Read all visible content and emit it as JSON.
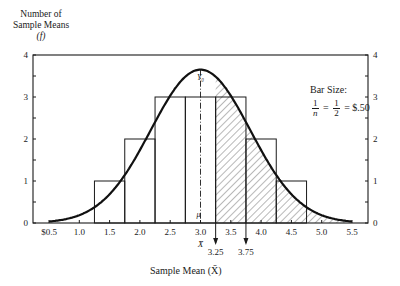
{
  "chart_data": {
    "type": "bar",
    "title": "",
    "ylabel_lines": [
      "Number of",
      "Sample Means",
      "(f)"
    ],
    "xlabel": "Sample Mean (X̄)",
    "x_tick_labels": [
      "$0.5",
      "1.0",
      "1.5",
      "2.0",
      "2.5",
      "3.0",
      "3.5",
      "4.0",
      "4.5",
      "5.0",
      "5.5"
    ],
    "x_ticks": [
      0.5,
      1.0,
      1.5,
      2.0,
      2.5,
      3.0,
      3.5,
      4.0,
      4.5,
      5.0,
      5.5
    ],
    "y_ticks_left": [
      0,
      1,
      2,
      3,
      4
    ],
    "y_ticks_right": [
      0,
      1,
      2,
      3,
      4
    ],
    "xlim": [
      0.5,
      5.5
    ],
    "ylim": [
      0,
      4
    ],
    "grid": false,
    "categories": [
      "1.5",
      "2.0",
      "2.5",
      "3.0",
      "3.5",
      "4.0",
      "4.5"
    ],
    "bins": [
      [
        1.25,
        1.75
      ],
      [
        1.75,
        2.25
      ],
      [
        2.25,
        2.75
      ],
      [
        2.75,
        3.25
      ],
      [
        3.25,
        3.75
      ],
      [
        3.75,
        4.25
      ],
      [
        4.25,
        4.75
      ]
    ],
    "values": [
      1,
      2,
      3,
      3,
      3,
      2,
      1
    ],
    "series": [
      {
        "name": "Sample mean frequency (histogram)",
        "type": "bar",
        "x": [
          1.5,
          2.0,
          2.5,
          3.0,
          3.5,
          4.0,
          4.5
        ],
        "values": [
          1,
          2,
          3,
          3,
          3,
          2,
          1
        ]
      },
      {
        "name": "Normal approximation curve",
        "type": "line",
        "x": [
          0.5,
          1.0,
          1.5,
          2.0,
          2.5,
          3.0,
          3.5,
          4.0,
          4.5,
          5.0,
          5.5
        ],
        "values": [
          0.05,
          0.25,
          0.7,
          1.6,
          2.8,
          3.65,
          2.8,
          1.6,
          0.7,
          0.25,
          0.05
        ]
      }
    ],
    "shaded_region": {
      "from": 3.25,
      "to": 5.5,
      "pattern": "diagonal hatch"
    },
    "annotations": {
      "peak_label": "Y₀",
      "mean_label": "μ",
      "mean_value": 3.0,
      "xbar_label": "X̄",
      "arrows": [
        {
          "x": 3.25,
          "label": "3.25"
        },
        {
          "x": 3.75,
          "label": "3.75"
        }
      ],
      "bar_size": {
        "title": "Bar Size:",
        "frac1_num": "1",
        "frac1_den": "n",
        "frac2_num": "1",
        "frac2_den": "2",
        "result": "$.50"
      }
    }
  }
}
